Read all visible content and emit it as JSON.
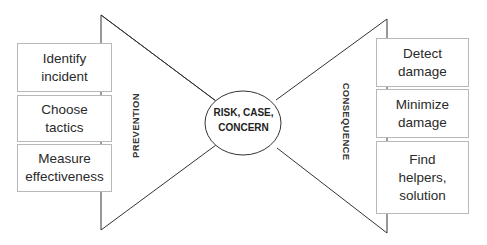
{
  "center": {
    "label": "RISK, CASE,\nCONCERN"
  },
  "left": {
    "label": "PREVENTION",
    "boxes": [
      {
        "label": "Identify\nincident"
      },
      {
        "label": "Choose\ntactics"
      },
      {
        "label": "Measure\neffectiveness"
      }
    ]
  },
  "right": {
    "label": "CONSEQUENCE",
    "boxes": [
      {
        "label": "Detect\ndamage"
      },
      {
        "label": "Minimize\ndamage"
      },
      {
        "label": "Find\nhelpers,\nsolution"
      }
    ]
  },
  "colors": {
    "line": "#333333",
    "box_border": "#b8b8b8"
  }
}
